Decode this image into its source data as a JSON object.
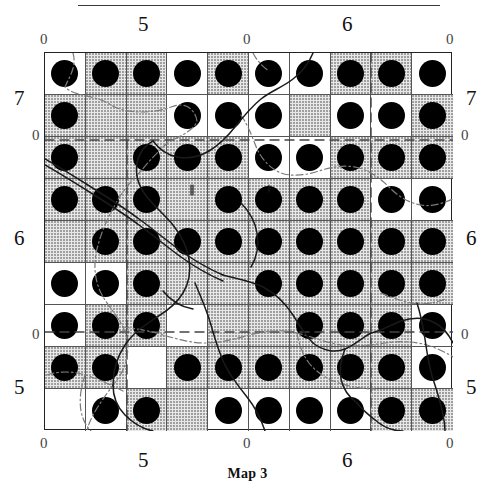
{
  "figure": {
    "caption": "Map 3",
    "top_rule": true
  },
  "axes": {
    "top_outer": [
      {
        "text": "0",
        "x": 40,
        "y": 32
      },
      {
        "text": "0",
        "x": 243,
        "y": 32
      },
      {
        "text": "0",
        "x": 446,
        "y": 32
      }
    ],
    "top_major": [
      {
        "text": "5",
        "x": 138,
        "y": 14
      },
      {
        "text": "6",
        "x": 342,
        "y": 14
      }
    ],
    "bottom_outer": [
      {
        "text": "0",
        "x": 40,
        "y": 436
      },
      {
        "text": "0",
        "x": 243,
        "y": 436
      },
      {
        "text": "0",
        "x": 446,
        "y": 436
      }
    ],
    "bottom_major": [
      {
        "text": "5",
        "x": 138,
        "y": 450
      },
      {
        "text": "6",
        "x": 342,
        "y": 450
      }
    ],
    "left_outer": [
      {
        "text": "0",
        "x": 32,
        "y": 128
      },
      {
        "text": "0",
        "x": 32,
        "y": 327
      }
    ],
    "left_major": [
      {
        "text": "7",
        "x": 14,
        "y": 88
      },
      {
        "text": "6",
        "x": 14,
        "y": 228
      },
      {
        "text": "5",
        "x": 14,
        "y": 377
      }
    ],
    "right_outer": [
      {
        "text": "0",
        "x": 461,
        "y": 128
      },
      {
        "text": "0",
        "x": 461,
        "y": 327
      }
    ],
    "right_major": [
      {
        "text": "7",
        "x": 466,
        "y": 88
      },
      {
        "text": "6",
        "x": 466,
        "y": 228
      },
      {
        "text": "5",
        "x": 466,
        "y": 377
      }
    ]
  },
  "grid": {
    "cols": 10,
    "rows": 9,
    "left": 44,
    "top": 52,
    "width": 408,
    "height": 378,
    "dot_diameter": 27,
    "dot_color": "#000000",
    "shade_color": "#e8e8e8",
    "line_color": "#555555",
    "frame_color": "#222222",
    "dots": [
      [
        1,
        1,
        1,
        1,
        1,
        1,
        1,
        1,
        1,
        1
      ],
      [
        1,
        0,
        0,
        1,
        1,
        1,
        0,
        1,
        1,
        1
      ],
      [
        1,
        0,
        1,
        1,
        1,
        1,
        1,
        1,
        1,
        1
      ],
      [
        1,
        1,
        1,
        0,
        1,
        1,
        1,
        1,
        1,
        1
      ],
      [
        0,
        1,
        1,
        1,
        1,
        1,
        1,
        1,
        1,
        1
      ],
      [
        1,
        1,
        1,
        0,
        0,
        1,
        1,
        1,
        1,
        1
      ],
      [
        1,
        1,
        1,
        0,
        0,
        0,
        1,
        1,
        1,
        1
      ],
      [
        1,
        1,
        0,
        1,
        1,
        1,
        1,
        1,
        1,
        1
      ],
      [
        0,
        1,
        1,
        0,
        1,
        1,
        1,
        1,
        1,
        1
      ]
    ],
    "shading": [
      [
        0,
        1,
        1,
        0,
        1,
        0,
        0,
        1,
        1,
        0
      ],
      [
        1,
        1,
        1,
        0,
        0,
        0,
        1,
        0,
        0,
        1
      ],
      [
        1,
        1,
        1,
        1,
        1,
        0,
        0,
        1,
        1,
        1
      ],
      [
        1,
        1,
        1,
        1,
        1,
        1,
        1,
        1,
        0,
        0
      ],
      [
        1,
        1,
        1,
        1,
        1,
        1,
        1,
        1,
        1,
        1
      ],
      [
        0,
        0,
        1,
        1,
        1,
        1,
        1,
        1,
        1,
        1
      ],
      [
        0,
        1,
        1,
        0,
        1,
        1,
        1,
        1,
        1,
        0
      ],
      [
        1,
        1,
        0,
        1,
        1,
        1,
        1,
        1,
        1,
        0
      ],
      [
        0,
        0,
        1,
        1,
        0,
        0,
        0,
        0,
        1,
        1
      ]
    ]
  },
  "overlay": {
    "river_color": "#1a1a1a",
    "border_color": "#6b6b6b",
    "grid_dash_color": "#444444",
    "dashed_vertical_x": [
      126,
      370
    ],
    "dashed_horizontal_y": [
      139,
      331
    ]
  }
}
